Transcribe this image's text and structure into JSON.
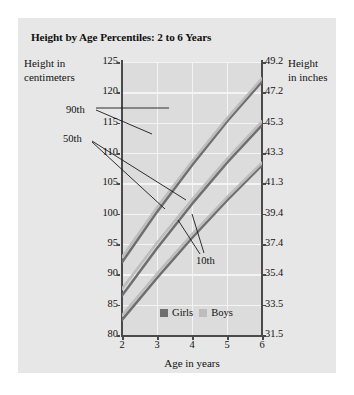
{
  "title": "Height by Age Percentiles: 2 to 6 Years",
  "axis_caption_left_line1": "Height in",
  "axis_caption_left_line2": "centimeters",
  "axis_caption_right_line1": "Height",
  "axis_caption_right_line2": "in inches",
  "legend": {
    "girls_label": "Girls",
    "boys_label": "Boys",
    "girls_color": "#6f6f6f",
    "boys_color": "#bdbdbd"
  },
  "annotations": [
    {
      "label": "90th"
    },
    {
      "label": "50th"
    },
    {
      "label": "10th"
    }
  ],
  "chart_data": {
    "type": "line",
    "title": "Height by Age Percentiles: 2 to 6 Years",
    "xlabel": "Age in years",
    "ylabel": "Height in centimeters",
    "ylabel_secondary": "Height in inches",
    "grid": true,
    "legend_position": "bottom-center",
    "x": [
      2,
      3,
      4,
      5,
      6
    ],
    "xlim": [
      2,
      6
    ],
    "xticks": [
      2,
      3,
      4,
      5,
      6
    ],
    "xtick_labels": [
      "2",
      "3",
      "4",
      "5",
      "6"
    ],
    "ylim": [
      80,
      125
    ],
    "yticks": [
      80,
      85,
      90,
      95,
      100,
      105,
      110,
      115,
      120,
      125
    ],
    "ytick_labels": [
      "80",
      "85",
      "90",
      "95",
      "100",
      "105",
      "110",
      "115",
      "120",
      "125"
    ],
    "ylim_secondary": [
      31.5,
      49.2
    ],
    "yticks_secondary": [
      31.5,
      33.5,
      35.4,
      37.4,
      39.4,
      41.3,
      43.3,
      45.3,
      47.2,
      49.2
    ],
    "ytick_labels_secondary": [
      "31.5",
      "33.5",
      "35.4",
      "37.4",
      "39.4",
      "41.3",
      "43.3",
      "45.3",
      "47.2",
      "49.2"
    ],
    "series": [
      {
        "name": "Girls 90th",
        "percentile": "90th",
        "sex": "Girls",
        "color": "#6f6f6f",
        "values": [
          92.0,
          100.3,
          108.0,
          115.2,
          121.8
        ]
      },
      {
        "name": "Boys 90th",
        "percentile": "90th",
        "sex": "Boys",
        "color": "#bdbdbd",
        "values": [
          92.8,
          101.0,
          108.6,
          115.7,
          122.3
        ]
      },
      {
        "name": "Girls 50th",
        "percentile": "50th",
        "sex": "Girls",
        "color": "#6f6f6f",
        "values": [
          86.5,
          94.3,
          101.6,
          108.4,
          114.6
        ]
      },
      {
        "name": "Boys 50th",
        "percentile": "50th",
        "sex": "Boys",
        "color": "#bdbdbd",
        "values": [
          87.6,
          95.2,
          102.3,
          109.0,
          115.2
        ]
      },
      {
        "name": "Girls 10th",
        "percentile": "10th",
        "sex": "Girls",
        "color": "#6f6f6f",
        "values": [
          82.5,
          89.4,
          96.0,
          102.2,
          108.0
        ]
      },
      {
        "name": "Boys 10th",
        "percentile": "10th",
        "sex": "Boys",
        "color": "#bdbdbd",
        "values": [
          83.2,
          90.1,
          96.6,
          102.7,
          108.4
        ]
      }
    ]
  }
}
